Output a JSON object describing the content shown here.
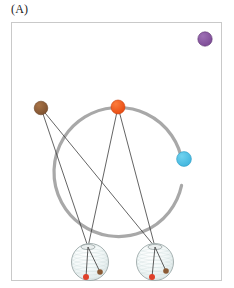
{
  "figure": {
    "panel_label": "(A)",
    "background_color": "#ffffff",
    "frame": {
      "x": 11,
      "y": 22,
      "width": 211,
      "height": 259,
      "stroke_color": "#c9c9c9",
      "stroke_width": 1
    }
  },
  "chart_data": {
    "type": "scatter",
    "title": "(A)",
    "xlabel": "",
    "ylabel": "",
    "xlim": [
      11,
      222
    ],
    "ylim": [
      22,
      281
    ],
    "grid": false,
    "legend": "none",
    "orbit_ring": {
      "name": "orbit-ring",
      "center_x": 118.5,
      "center_y": 172,
      "radius": 64.5,
      "stroke_color": "#a8a8a8",
      "stroke_width": 3.2,
      "start_angle_deg": 12,
      "end_angle_deg": 352
    },
    "nodes": [
      {
        "name": "purple-node",
        "label": "purple",
        "x": 205.0,
        "y": 39.0,
        "r": 7.2,
        "color": "#7d4b96",
        "edge_color": "#5d3471",
        "on_ring": false
      },
      {
        "name": "brown-node",
        "label": "brown",
        "x": 41.0,
        "y": 108.0,
        "r": 6.8,
        "color": "#8a5a35",
        "edge_color": "#6a4224",
        "on_ring": false
      },
      {
        "name": "orange-node",
        "label": "orange",
        "x": 118.0,
        "y": 107.0,
        "r": 7.0,
        "color": "#ef5a22",
        "edge_color": "#c8410f",
        "on_ring": true
      },
      {
        "name": "cyan-node",
        "label": "cyan",
        "x": 184.0,
        "y": 159.0,
        "r": 7.4,
        "color": "#49bde2",
        "edge_color": "#2f9cc2",
        "on_ring": true
      }
    ],
    "spheres": [
      {
        "name": "sphere-left",
        "x": 90.0,
        "y": 262.0,
        "r": 18.5,
        "fill_color": "#f2f7f7",
        "edge_color": "#9aa6a6",
        "hub_x": 88.0,
        "hub_y": 247.0,
        "markers": [
          {
            "name": "sphere-left-red-marker",
            "x": 86.0,
            "y": 277.0,
            "r": 3.0,
            "color": "#e0402a"
          },
          {
            "name": "sphere-left-brown-marker",
            "x": 100.0,
            "y": 272.0,
            "r": 2.8,
            "color": "#8a5a35"
          }
        ]
      },
      {
        "name": "sphere-right",
        "x": 155.0,
        "y": 262.0,
        "r": 18.5,
        "fill_color": "#f2f7f7",
        "edge_color": "#9aa6a6",
        "hub_x": 155.0,
        "hub_y": 247.0,
        "markers": [
          {
            "name": "sphere-right-red-marker",
            "x": 152.0,
            "y": 277.0,
            "r": 3.0,
            "color": "#e0402a"
          },
          {
            "name": "sphere-right-brown-marker",
            "x": 166.0,
            "y": 271.0,
            "r": 2.8,
            "color": "#8a5a35"
          }
        ]
      }
    ],
    "sight_lines": [
      {
        "name": "line-brown-to-left-sphere",
        "x1": 41.0,
        "y1": 108.0,
        "x2": 88.0,
        "y2": 247.0,
        "stroke_color": "#3c3c3c",
        "stroke_width": 0.8
      },
      {
        "name": "line-brown-to-right-sphere",
        "x1": 41.0,
        "y1": 108.0,
        "x2": 155.0,
        "y2": 247.0,
        "stroke_color": "#3c3c3c",
        "stroke_width": 0.8
      },
      {
        "name": "line-orange-to-left-sphere",
        "x1": 118.0,
        "y1": 107.0,
        "x2": 88.0,
        "y2": 247.0,
        "stroke_color": "#3c3c3c",
        "stroke_width": 0.8
      },
      {
        "name": "line-orange-to-right-sphere",
        "x1": 118.0,
        "y1": 107.0,
        "x2": 155.0,
        "y2": 247.0,
        "stroke_color": "#3c3c3c",
        "stroke_width": 0.8
      }
    ],
    "sphere_internal_lines": [
      {
        "name": "sphere-left-spoke-red",
        "x1": 88.0,
        "y1": 247.0,
        "x2": 86.0,
        "y2": 277.0,
        "stroke_color": "#4a4a4a",
        "stroke_width": 0.9
      },
      {
        "name": "sphere-left-spoke-brown",
        "x1": 88.0,
        "y1": 247.0,
        "x2": 100.0,
        "y2": 272.0,
        "stroke_color": "#4a4a4a",
        "stroke_width": 0.9
      },
      {
        "name": "sphere-right-spoke-red",
        "x1": 155.0,
        "y1": 247.0,
        "x2": 152.0,
        "y2": 277.0,
        "stroke_color": "#4a4a4a",
        "stroke_width": 0.9
      },
      {
        "name": "sphere-right-spoke-brown",
        "x1": 155.0,
        "y1": 247.0,
        "x2": 166.0,
        "y2": 271.0,
        "stroke_color": "#4a4a4a",
        "stroke_width": 0.9
      }
    ]
  }
}
